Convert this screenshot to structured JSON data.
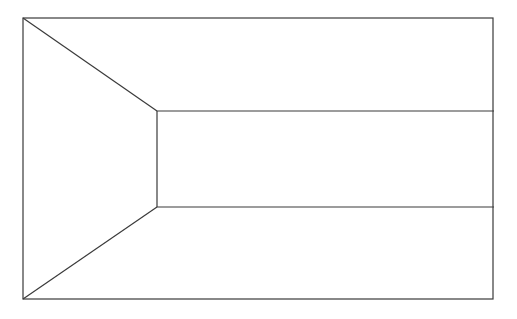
{
  "diagram": {
    "stroke_color": "#3a3a3a",
    "background_color": "#ffffff",
    "outer_rect": {
      "x1": 23,
      "y1": 18,
      "x2": 493,
      "y2": 299
    },
    "trapezoid": {
      "top_inner": [
        157,
        111
      ],
      "bottom_inner": [
        157,
        207
      ]
    },
    "band_lines_y": [
      111,
      207
    ],
    "band_line_x_end": 494
  }
}
